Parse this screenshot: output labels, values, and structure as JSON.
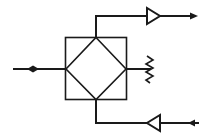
{
  "diagram": {
    "type": "rf-block-schematic",
    "colors": {
      "stroke": "#1a1a1a",
      "background": "#ffffff"
    },
    "components": [
      {
        "id": "input-port",
        "kind": "bidirectional-arrow-input",
        "label": ""
      },
      {
        "id": "hybrid-coupler",
        "kind": "square-with-diamond",
        "label": ""
      },
      {
        "id": "termination",
        "kind": "resistor-load",
        "label": ""
      },
      {
        "id": "tx-amplifier",
        "kind": "triangle-amplifier",
        "direction": "right",
        "label": ""
      },
      {
        "id": "tx-output",
        "kind": "arrow-out",
        "direction": "right",
        "label": ""
      },
      {
        "id": "rx-amplifier",
        "kind": "triangle-amplifier",
        "direction": "left",
        "label": ""
      },
      {
        "id": "rx-input",
        "kind": "arrow-in",
        "direction": "left",
        "label": ""
      }
    ]
  }
}
